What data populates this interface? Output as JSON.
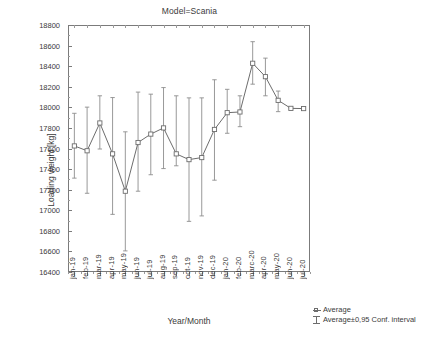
{
  "chart_data": {
    "type": "line",
    "title": "Model=Scania",
    "xlabel": "Year/Month",
    "ylabel": "Loading weight [kg]",
    "ylim": [
      16400,
      18800
    ],
    "ytick_step": 200,
    "yticks": [
      16400,
      16600,
      16800,
      17000,
      17200,
      17400,
      17600,
      17800,
      18000,
      18200,
      18400,
      18600,
      18800
    ],
    "grid": false,
    "legend_position": "bottom-right",
    "categories": [
      "jan-19",
      "feb-19",
      "mar-19",
      "apr-19",
      "may-19",
      "jun-19",
      "jul-19",
      "aug-19",
      "sep-19",
      "oct-19",
      "nov-19",
      "dec-19",
      "jan-20",
      "feb-20",
      "marc-20",
      "apr-20",
      "may-20",
      "jun-20",
      "jul-20"
    ],
    "series": [
      {
        "name": "Average",
        "values": [
          17625,
          17578,
          17848,
          17548,
          17185,
          17658,
          17740,
          17800,
          17548,
          17492,
          17512,
          17785,
          17948,
          17955,
          18428,
          18298,
          18068,
          17990,
          17988
        ]
      }
    ],
    "error_bars": {
      "name": "Average±0,95 Conf. interval",
      "lower": [
        17312,
        17165,
        17595,
        16960,
        16605,
        17185,
        17345,
        17405,
        17432,
        16892,
        16945,
        17292,
        17748,
        17812,
        18225,
        18112,
        17958,
        17985,
        17983
      ],
      "upper": [
        17942,
        18002,
        18112,
        18095,
        17762,
        18148,
        18128,
        18192,
        18112,
        18092,
        18092,
        18268,
        18175,
        18112,
        18638,
        18478,
        18158,
        17998,
        17995
      ]
    },
    "legend": [
      {
        "key": "marker-square",
        "label": "Average"
      },
      {
        "key": "ibeam",
        "label": "Average±0,95 Conf. interval"
      }
    ],
    "style": {
      "line_color": "#6d6d6d",
      "marker_color": "#6d6d6d",
      "marker_fill": "#ffffff",
      "error_color": "#8d8d8d",
      "axis_color": "#7b7b7b",
      "text_color": "#3a3a3a",
      "background": "#ffffff"
    }
  },
  "geometry": {
    "plot_left": 68,
    "plot_right": 310,
    "plot_top": 25,
    "plot_bottom": 272
  }
}
